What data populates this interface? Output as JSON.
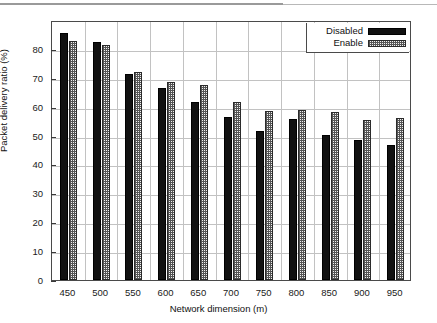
{
  "chart_data": {
    "type": "bar",
    "title": "",
    "xlabel": "Network dimension (m)",
    "ylabel": "Packet delivery ratio (%)",
    "categories": [
      "450",
      "500",
      "550",
      "600",
      "650",
      "700",
      "750",
      "800",
      "850",
      "900",
      "950"
    ],
    "series": [
      {
        "name": "Disabled",
        "style": "solid-black",
        "values": [
          85.6,
          82.5,
          71.3,
          66.3,
          61.5,
          56.4,
          51.7,
          55.9,
          50.3,
          48.4,
          46.6
        ]
      },
      {
        "name": "Enable",
        "style": "dotted-hatch",
        "values": [
          82.8,
          81.3,
          72.0,
          68.4,
          67.6,
          61.5,
          58.4,
          58.7,
          58.3,
          55.5,
          56.1
        ]
      }
    ],
    "ylim": [
      0,
      90
    ],
    "yticks": [
      0,
      10,
      20,
      30,
      40,
      50,
      60,
      70,
      80
    ],
    "ytick_labels": [
      "0",
      "10",
      "20",
      "30",
      "40",
      "50",
      "60",
      "70",
      "80"
    ],
    "xtick_labels": [
      "450",
      "500",
      "550",
      "600",
      "650",
      "700",
      "750",
      "800",
      "850",
      "900",
      "950"
    ],
    "grid": true,
    "legend_position": "top-right",
    "legend_entries": [
      "Disabled",
      "Enable"
    ]
  },
  "legend": {
    "entries": [
      {
        "label": "Disabled",
        "swatch": "solid-black-swatch"
      },
      {
        "label": "Enable",
        "swatch": "dotted-hatch-swatch"
      }
    ]
  },
  "axes": {
    "y_title": "Packet delivery ratio (%)",
    "x_title": "Network dimension (m)"
  }
}
